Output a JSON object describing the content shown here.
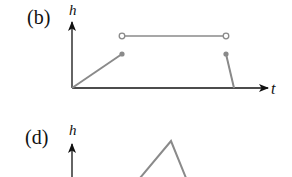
{
  "panels": [
    {
      "id": "b",
      "label": "(b)",
      "y_axis_label": "h",
      "x_axis_label": "t",
      "description": "Height rises linearly to a filled point, jumps to a constant level (open endpoints), then drops back from a filled point to zero."
    },
    {
      "id": "d",
      "label": "(d)",
      "y_axis_label": "h",
      "description": "Height rises linearly to a peak and falls (triangular shape), partially visible."
    }
  ],
  "colors": {
    "axis": "#111111",
    "curve": "#8a8a8a"
  }
}
